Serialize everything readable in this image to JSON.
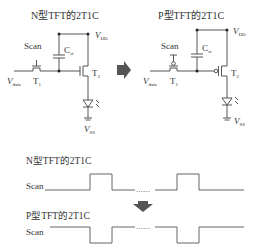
{
  "left_circuit": {
    "title": "N型TFT的2T1C",
    "scan": "Scan",
    "cap": "C",
    "cap_sub": "st",
    "vdd": "V",
    "vdd_sub": "DD",
    "vdata": "V",
    "vdata_sub": "data",
    "t1": "T",
    "t1_sub": "1",
    "t2": "T",
    "t2_sub": "2",
    "vss": "V",
    "vss_sub": "SS"
  },
  "right_circuit": {
    "title": "P型TFT的2T1C",
    "scan": "Scan",
    "cap": "C",
    "cap_sub": "st",
    "vdd": "V",
    "vdd_sub": "DD",
    "vdata": "V",
    "vdata_sub": "data",
    "t1": "T",
    "t1_sub": "1",
    "t2": "T",
    "t2_sub": "2",
    "vss": "V",
    "vss_sub": "SS"
  },
  "waveforms": {
    "n_title": "N型TFT的2T1C",
    "n_label": "Scan",
    "p_title": "P型TFT的2T1C",
    "p_label": "Scan",
    "ellipsis": "……"
  },
  "colors": {
    "arrow": "#555555",
    "line": "#444444"
  }
}
